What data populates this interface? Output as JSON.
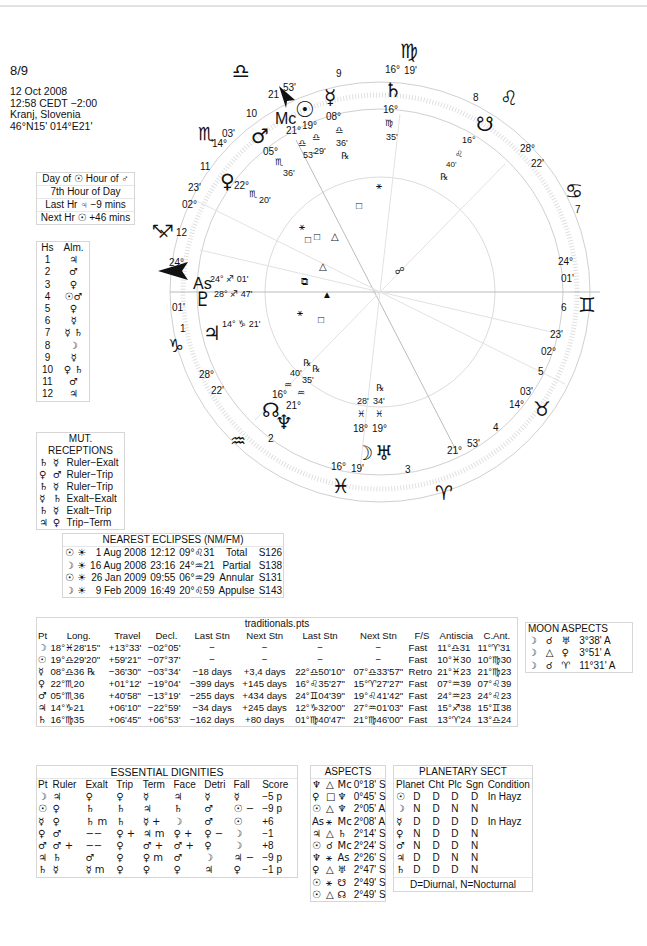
{
  "header": {
    "title": "8/9",
    "date": "12 Oct 2008",
    "time": "12:58  CEDT −2:00",
    "place": "Kranj, Slovenia",
    "coords": "46°N15' 014°E21'"
  },
  "planetary_hours": {
    "row1": "Day of ☉  Hour of ♂",
    "row2": "7th Hour of Day",
    "row3": "Last Hr ♃ −9 mins",
    "row4": "Next Hr ☉ +46 mins"
  },
  "almutens": {
    "headers": [
      "Hs",
      "Alm."
    ],
    "rows": [
      [
        "1",
        "♃"
      ],
      [
        "2",
        "♂"
      ],
      [
        "3",
        "♀"
      ],
      [
        "4",
        "☉♂"
      ],
      [
        "5",
        "♀"
      ],
      [
        "6",
        "☿"
      ],
      [
        "7",
        "☿ ♄"
      ],
      [
        "8",
        "☽"
      ],
      [
        "9",
        "☿"
      ],
      [
        "10",
        "♀ ♄"
      ],
      [
        "11",
        "♂"
      ],
      [
        "12",
        "♃"
      ]
    ]
  },
  "mutual_receptions": {
    "title": "MUT. RECEPTIONS",
    "rows": [
      [
        "♄",
        "☿",
        "Ruler−Exalt"
      ],
      [
        "♀",
        "♂",
        "Ruler−Trip"
      ],
      [
        "♄",
        "☿",
        "Ruler−Trip"
      ],
      [
        "☿",
        "♄",
        "Exalt−Exalt"
      ],
      [
        "♄",
        "☿",
        "Exalt−Trip"
      ],
      [
        "♃",
        "♀",
        "Trip−Term"
      ]
    ]
  },
  "eclipses": {
    "title": "NEAREST ECLIPSES (NM/FM)",
    "rows": [
      [
        "☉ ☀",
        "1 Aug 2008",
        "12:12",
        "09°♌31",
        "Total",
        "S126"
      ],
      [
        "☽ ☀",
        "16 Aug 2008",
        "23:16",
        "24°♒︎21",
        "Partial",
        "S138"
      ],
      [
        "☉ ☀",
        "26 Jan 2009",
        "09:55",
        "06°♒︎29",
        "Annular",
        "S131"
      ],
      [
        "☽ ☀",
        "9 Feb 2009",
        "16:49",
        "20°♌59",
        "Appulse",
        "S143"
      ]
    ]
  },
  "points": {
    "title": "traditionals.pts",
    "headers": [
      "Pt",
      "Long.",
      "Travel",
      "Decl.",
      "Last Stn",
      "Next Stn",
      "Last Stn",
      "Next Stn",
      "F/S",
      "Antiscia",
      "C.Ant."
    ],
    "rows": [
      [
        "☽",
        "18°♓︎28'15\"",
        "+13°33'",
        "−02°05'",
        "−",
        "−",
        "−",
        "−",
        "Fast",
        "11°♎︎31",
        "11°♈︎31"
      ],
      [
        "☉",
        "19°♎︎29'20\"",
        "+59'21\"",
        "−07°37'",
        "−",
        "−",
        "−",
        "−",
        "Fast",
        "10°♓︎30",
        "10°♍︎30"
      ],
      [
        "☿",
        "08°♎︎36 ℞",
        "−36'30\"",
        "−03°34'",
        "−18 days",
        "+3,4 days",
        "22°♎︎50'10\"",
        "07°♎︎33'57\"",
        "Retro",
        "21°♓︎23",
        "21°♍︎23"
      ],
      [
        "♀",
        "22°♏︎20",
        "+01°12'",
        "−19°04'",
        "−399 days",
        "+145 days",
        "16°♌︎35'27\"",
        "15°♈︎27'27\"",
        "Fast",
        "07°♒︎39",
        "07°♌︎39"
      ],
      [
        "♂",
        "05°♏︎36",
        "+40'58\"",
        "−13°19'",
        "−255 days",
        "+434 days",
        "24°♊︎04'39\"",
        "19°♌︎41'42\"",
        "Fast",
        "24°♒︎23",
        "24°♌︎23"
      ],
      [
        "♃",
        "14°♑︎21",
        "+06'10\"",
        "−22°59'",
        "−34 days",
        "+245 days",
        "12°♑︎32'00\"",
        "27°♒︎01'03\"",
        "Fast",
        "15°♐︎38",
        "15°♊︎38"
      ],
      [
        "♄",
        "16°♍︎35",
        "+06'45\"",
        "+06°53'",
        "−162 days",
        "+80 days",
        "01°♍︎40'47\"",
        "21°♍︎46'00\"",
        "Fast",
        "13°♈︎24",
        "13°♎︎24"
      ]
    ]
  },
  "moon_aspects": {
    "title": "MOON ASPECTS",
    "rows": [
      [
        "☽",
        "☌",
        "♅",
        "3°38' A"
      ],
      [
        "☽",
        "△",
        "♀",
        "3°51' A"
      ],
      [
        "☽",
        "☌",
        "♈︎",
        "11°31' A"
      ]
    ]
  },
  "dignities": {
    "title": "ESSENTIAL DIGNITIES",
    "headers": [
      "Pt",
      "Ruler",
      "Exalt",
      "Trip",
      "Term",
      "Face",
      "Detri",
      "Fall",
      "Score"
    ],
    "rows": [
      [
        "☽",
        "♃",
        "♀",
        "♀",
        "☿",
        "♃",
        "☿",
        "☿",
        "−5 p"
      ],
      [
        "☉",
        "♀",
        "♄",
        "♄",
        "♃",
        "♄",
        "♂",
        "☉ −",
        "−9 p"
      ],
      [
        "☿",
        "♀",
        "♄ m",
        "♄",
        "☿ +",
        "☽",
        "♂",
        "☉",
        "+6"
      ],
      [
        "♀",
        "♂",
        "−−",
        "♀ +",
        "♃ m",
        "♀ +",
        "♀ −",
        "☽",
        "−1"
      ],
      [
        "♂",
        "♂ +",
        "−−",
        "♀",
        "♂ +",
        "♂ +",
        "♀",
        "☽",
        "+8"
      ],
      [
        "♃",
        "♄",
        "♂",
        "♀",
        "♀ m",
        "♂",
        "☽",
        "♃ −",
        "−9 p"
      ],
      [
        "♄",
        "☿",
        "☿ m",
        "♀",
        "♀",
        "♀",
        "♃",
        "♀",
        "−1 p"
      ]
    ]
  },
  "aspects": {
    "title": "ASPECTS",
    "rows": [
      [
        "♆",
        "△",
        "Mc",
        "0°18' S"
      ],
      [
        "♀",
        "□",
        "♆",
        "0°45' S"
      ],
      [
        "☉",
        "△",
        "♆",
        "2°05' A"
      ],
      [
        "As",
        "⚹",
        "Mc",
        "2°08' A"
      ],
      [
        "♃",
        "△",
        "♄",
        "2°14' S"
      ],
      [
        "☉",
        "☌",
        "Mc",
        "2°24' S"
      ],
      [
        "♆",
        "⚹",
        "As",
        "2°26' S"
      ],
      [
        "♀",
        "△",
        "♅",
        "2°47' S"
      ],
      [
        "☉",
        "⚹",
        "☋",
        "2°49' S"
      ],
      [
        "☉",
        "△",
        "☊",
        "2°49' S"
      ]
    ]
  },
  "sect": {
    "title": "PLANETARY SECT",
    "headers": [
      "Planet",
      "Cht",
      "Plc",
      "Sgn",
      "Condition"
    ],
    "rows": [
      [
        "☉",
        "D",
        "D",
        "D",
        "D",
        "In Hayz"
      ],
      [
        "☽",
        "N",
        "D",
        "N",
        "N",
        ""
      ],
      [
        "☿",
        "D",
        "D",
        "D",
        "D",
        "In Hayz"
      ],
      [
        "♀",
        "N",
        "D",
        "D",
        "N",
        ""
      ],
      [
        "♂",
        "N",
        "D",
        "D",
        "N",
        ""
      ],
      [
        "♃",
        "D",
        "D",
        "N",
        "N",
        ""
      ],
      [
        "♄",
        "D",
        "D",
        "D",
        "N",
        ""
      ]
    ],
    "footer": "D=Diurnal, N=Nocturnal"
  },
  "wheel": {
    "ascendant": {
      "deg": "24°",
      "min": "01'",
      "label": "As"
    },
    "descendant": {
      "deg": "24°",
      "min": "01'"
    },
    "midheaven": {
      "deg": "21",
      "min": "53'",
      "label": "Mc"
    },
    "ic": {
      "deg": "21°",
      "min": "53'"
    },
    "signs": [
      "♎︎",
      "♍︎",
      "♌︎",
      "♋︎",
      "♊︎",
      "♉︎",
      "♈︎",
      "♓︎",
      "♒︎",
      "♑︎",
      "♐︎",
      "♏︎"
    ],
    "house_numbers": [
      "1",
      "2",
      "3",
      "4",
      "5",
      "6",
      "7",
      "8",
      "9",
      "10",
      "11",
      "12"
    ],
    "cusps": {
      "c11": {
        "deg": "14°",
        "min": "03'"
      },
      "c12": {
        "deg": "02°",
        "min": "23'"
      },
      "c2": {
        "deg": "28°",
        "min": "22'"
      },
      "c3": {
        "deg": "16°",
        "min": "19'"
      },
      "c5": {
        "deg": "14°",
        "min": "03'"
      },
      "c6": {
        "deg": "02°",
        "min": "23'"
      },
      "c8": {
        "deg": "28°",
        "min": "22'"
      },
      "c9": {
        "deg": "16°",
        "min": "19'"
      }
    },
    "planets": {
      "sun": {
        "glyph": "☉",
        "deg": "19°",
        "sign": "♎︎",
        "min": "29'"
      },
      "mercury": {
        "glyph": "☿",
        "deg": "08°",
        "sign": "♎︎",
        "min": "36'",
        "retro": "℞"
      },
      "saturn": {
        "glyph": "♄",
        "deg": "16°",
        "sign": "♍︎",
        "min": "35'"
      },
      "mars": {
        "glyph": "♂",
        "deg": "05°",
        "sign": "♏︎",
        "min": "36'"
      },
      "venus": {
        "glyph": "♀",
        "deg": "22°",
        "sign": "♏︎",
        "min": "20'"
      },
      "pluto": {
        "glyph": "♇",
        "text": "28° ♐︎ 47'"
      },
      "ascendant_text": "24° ♐︎ 01'",
      "jupiter": {
        "glyph": "♃",
        "text": "14° ♑︎ 21'"
      },
      "node": {
        "glyph": "☊",
        "deg": "16°",
        "sign": "♒︎",
        "min": "40'",
        "retro": "℞"
      },
      "neptune": {
        "glyph": "♆",
        "deg": "21°",
        "sign": "♒︎",
        "min": "35'",
        "retro": "℞"
      },
      "moon": {
        "glyph": "☽",
        "deg": "18°",
        "sign": "♓︎",
        "min": "28'"
      },
      "uranus": {
        "glyph": "♅",
        "deg": "19°",
        "sign": "♓︎",
        "min": "34'",
        "retro": "℞"
      },
      "south_node": {
        "glyph": "☋",
        "deg": "16°",
        "sign": "♌︎",
        "min": "40'",
        "retro": "℞"
      },
      "fortune": {
        "glyph": "⊗"
      }
    }
  }
}
